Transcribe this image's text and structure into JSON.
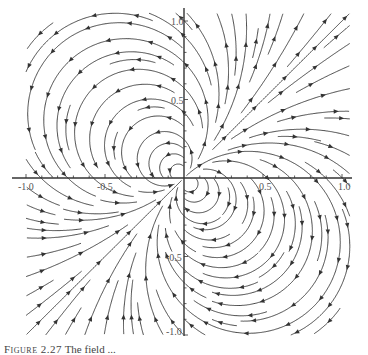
{
  "chart_data": {
    "type": "streamplot",
    "title": "",
    "xlabel": "",
    "ylabel": "",
    "xlim": [
      -1.0,
      1.0
    ],
    "ylim": [
      -1.0,
      1.0
    ],
    "x_ticks": [
      "-1.0",
      "-0.5",
      "0.5",
      "1.0"
    ],
    "y_ticks": [
      "1.0",
      "0.5",
      "-0.5",
      "-1.0"
    ],
    "grid": false,
    "legend": null
  },
  "axes": {
    "x_tick_labels": {
      "neg1": "-1.0",
      "neg05": "-0.5",
      "pos05": "0.5",
      "pos1": "1.0"
    },
    "y_tick_labels": {
      "pos1": "1.0",
      "pos05": "0.5",
      "neg05": "-0.5",
      "neg1": "-1.0"
    }
  },
  "caption": {
    "label": "Figure 2.27",
    "text": "The field ... "
  },
  "colors": {
    "stroke": "#333333",
    "axis": "#333333",
    "background": "#ffffff"
  }
}
